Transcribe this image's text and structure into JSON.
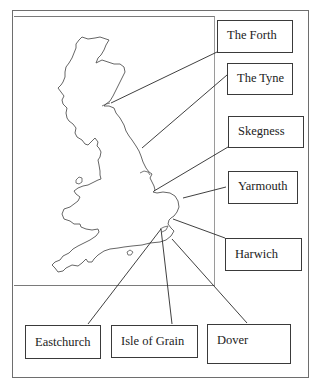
{
  "diagram": {
    "type": "labelled-map",
    "colors": {
      "outline": "#555555",
      "leader_line": "#2a2a2a",
      "box_border": "#3a3a3a",
      "frame": "#6e6e6e"
    },
    "labels": {
      "forth": "The Forth",
      "tyne": "The Tyne",
      "skegness": "Skegness",
      "yarmouth": "Yarmouth",
      "harwich": "Harwich",
      "eastchurch": "Eastchurch",
      "isle_of_grain": "Isle of Grain",
      "dover": "Dover"
    }
  }
}
